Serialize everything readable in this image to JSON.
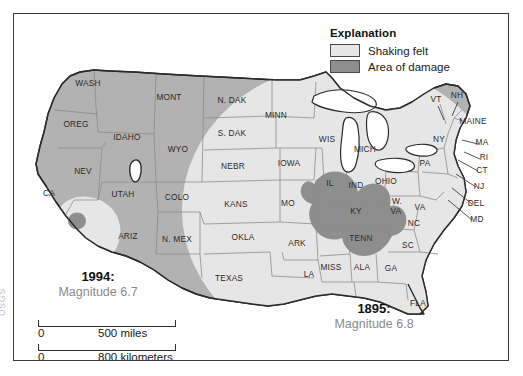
{
  "figure": {
    "kind": "usgs-earthquake-shaking-comparison-map",
    "region": "United States"
  },
  "legend": {
    "title": "Explanation",
    "items": [
      {
        "label": "Shaking felt",
        "color": "#e6e6e6",
        "swatch": "shaking-felt-swatch"
      },
      {
        "label": "Area of damage",
        "color": "#8e8e8e",
        "swatch": "area-of-damage-swatch"
      }
    ]
  },
  "annotations": {
    "quake_west": {
      "year": "1994:",
      "magnitude": "Magnitude 6.7"
    },
    "quake_east": {
      "year": "1895:",
      "magnitude": "Magnitude 6.8"
    }
  },
  "scale": {
    "miles": {
      "zero": "0",
      "value": "500 miles"
    },
    "kilometers": {
      "zero": "0",
      "value": "800 kilometers"
    }
  },
  "credit": {
    "text": "USGS"
  },
  "colors": {
    "land": "#b2b2b2",
    "shaking_felt": "#e6e6e6",
    "area_of_damage": "#8e8e8e",
    "water": "#ffffff",
    "border": "#3a3a3a",
    "state_line": "#8d8d8d",
    "coast_line": "#2b2b2b",
    "magnitude_text": "#8a8a8a"
  },
  "state_labels": [
    {
      "name": "WASH",
      "text": "WASH",
      "x": 74,
      "y": 72
    },
    {
      "name": "OREG",
      "text": "OREG",
      "x": 62,
      "y": 113
    },
    {
      "name": "CA",
      "text": "CA",
      "x": 35,
      "y": 182
    },
    {
      "name": "NEV",
      "text": "NEV",
      "x": 69,
      "y": 160
    },
    {
      "name": "IDAHO",
      "text": "IDAHO",
      "x": 113,
      "y": 126
    },
    {
      "name": "MONT",
      "text": "MONT",
      "x": 155,
      "y": 86
    },
    {
      "name": "WYO",
      "text": "WYO",
      "x": 164,
      "y": 138
    },
    {
      "name": "UTAH",
      "text": "UTAH",
      "x": 109,
      "y": 183
    },
    {
      "name": "ARIZ",
      "text": "ARIZ",
      "x": 114,
      "y": 225
    },
    {
      "name": "COLO",
      "text": "COLO",
      "x": 163,
      "y": 186
    },
    {
      "name": "N. MEX",
      "text": "N. MEX",
      "x": 163,
      "y": 228
    },
    {
      "name": "N. DAK",
      "text": "N. DAK",
      "x": 218,
      "y": 89
    },
    {
      "name": "S. DAK",
      "text": "S. DAK",
      "x": 218,
      "y": 122
    },
    {
      "name": "NEBR",
      "text": "NEBR",
      "x": 219,
      "y": 155
    },
    {
      "name": "KANS",
      "text": "KANS",
      "x": 222,
      "y": 193
    },
    {
      "name": "OKLA",
      "text": "OKLA",
      "x": 229,
      "y": 226
    },
    {
      "name": "TEXAS",
      "text": "TEXAS",
      "x": 215,
      "y": 267
    },
    {
      "name": "MINN",
      "text": "MINN",
      "x": 262,
      "y": 104
    },
    {
      "name": "IOWA",
      "text": "IOWA",
      "x": 275,
      "y": 152
    },
    {
      "name": "MO",
      "text": "MO",
      "x": 274,
      "y": 192
    },
    {
      "name": "ARK",
      "text": "ARK",
      "x": 283,
      "y": 232
    },
    {
      "name": "LA",
      "text": "LA",
      "x": 295,
      "y": 263
    },
    {
      "name": "WIS",
      "text": "WIS",
      "x": 313,
      "y": 128
    },
    {
      "name": "IL",
      "text": "IL",
      "x": 316,
      "y": 172
    },
    {
      "name": "MISS",
      "text": "MISS",
      "x": 317,
      "y": 256
    },
    {
      "name": "MICH",
      "text": "MICH",
      "x": 351,
      "y": 138
    },
    {
      "name": "IND",
      "text": "IND",
      "x": 342,
      "y": 174
    },
    {
      "name": "OHIO",
      "text": "OHIO",
      "x": 372,
      "y": 170
    },
    {
      "name": "KY",
      "text": "KY",
      "x": 342,
      "y": 200
    },
    {
      "name": "TENN",
      "text": "TENN",
      "x": 347,
      "y": 227
    },
    {
      "name": "ALA",
      "text": "ALA",
      "x": 348,
      "y": 256
    },
    {
      "name": "GA",
      "text": "GA",
      "x": 377,
      "y": 257
    },
    {
      "name": "FLA",
      "text": "FLA",
      "x": 404,
      "y": 292
    },
    {
      "name": "SC",
      "text": "SC",
      "x": 394,
      "y": 234
    },
    {
      "name": "NC",
      "text": "NC",
      "x": 400,
      "y": 212
    },
    {
      "name": "W. VA",
      "text": "W.",
      "x": 383,
      "y": 190
    },
    {
      "name": "W-VA-2",
      "text": "VA",
      "x": 382,
      "y": 200
    },
    {
      "name": "VA",
      "text": "VA",
      "x": 406,
      "y": 196
    },
    {
      "name": "PA",
      "text": "PA",
      "x": 411,
      "y": 152
    },
    {
      "name": "NY",
      "text": "NY",
      "x": 425,
      "y": 128
    },
    {
      "name": "VT",
      "text": "VT",
      "x": 422,
      "y": 88
    },
    {
      "name": "NH",
      "text": "NH",
      "x": 443,
      "y": 84
    },
    {
      "name": "MAINE",
      "text": "MAINE",
      "x": 459,
      "y": 110
    },
    {
      "name": "MA",
      "text": "MA",
      "x": 468,
      "y": 131
    },
    {
      "name": "RI",
      "text": "RI",
      "x": 470,
      "y": 146
    },
    {
      "name": "CT",
      "text": "CT",
      "x": 468,
      "y": 159
    },
    {
      "name": "NJ",
      "text": "NJ",
      "x": 465,
      "y": 175
    },
    {
      "name": "DEL",
      "text": "DEL",
      "x": 462,
      "y": 192
    },
    {
      "name": "MD",
      "text": "MD",
      "x": 463,
      "y": 208
    }
  ]
}
